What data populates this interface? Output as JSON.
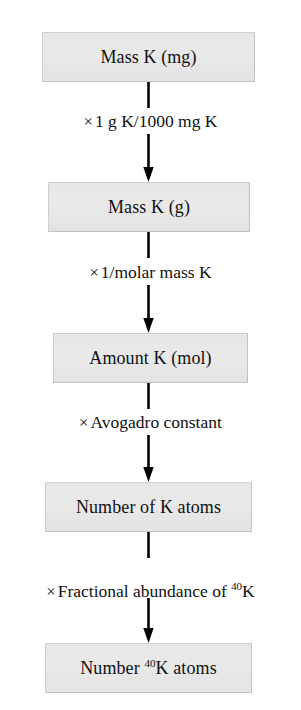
{
  "diagram": {
    "type": "flowchart",
    "orientation": "vertical",
    "colors": {
      "box_fill": "#e7e7e7",
      "box_border": "#c2c2c2",
      "text": "#111111",
      "arrow": "#000000",
      "background": "#ffffff"
    },
    "nodes": [
      {
        "id": "mass-k-mg",
        "label": "Mass K (mg)",
        "label_main": "Mass K (mg)",
        "superscript": ""
      },
      {
        "id": "mass-k-g",
        "label": "Mass K (g)",
        "label_main": "Mass K (g)",
        "superscript": ""
      },
      {
        "id": "amount-k-mol",
        "label": "Amount K (mol)",
        "label_main": "Amount K (mol)",
        "superscript": ""
      },
      {
        "id": "number-k-atoms",
        "label": "Number of K atoms",
        "label_main": "Number of K atoms",
        "superscript": ""
      },
      {
        "id": "number-k40-atoms",
        "label": "Number 40K atoms",
        "label_prefix": "Number ",
        "superscript": "40",
        "label_suffix": "K atoms"
      }
    ],
    "operations": [
      {
        "id": "op-mg-to-g",
        "times": "×",
        "text": "1 g K/1000 mg K"
      },
      {
        "id": "op-molar-mass",
        "times": "×",
        "text": "1/molar mass K"
      },
      {
        "id": "op-avogadro",
        "times": "×",
        "text": "Avogadro constant"
      },
      {
        "id": "op-abundance",
        "times": "×",
        "text_prefix": "Fractional abundance of ",
        "superscript": "40",
        "text_suffix": "K"
      }
    ]
  }
}
